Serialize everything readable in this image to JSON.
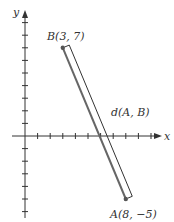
{
  "diagram": {
    "axes": {
      "x_label": "x",
      "y_label": "y",
      "origin_px": [
        25,
        136
      ],
      "unit_px": 12.6,
      "x_ticks": [
        1,
        2,
        3,
        4,
        5,
        6,
        7,
        8,
        9,
        10
      ],
      "y_ticks": [
        -6,
        -5,
        -4,
        -3,
        -2,
        -1,
        1,
        2,
        3,
        4,
        5,
        6,
        7,
        8,
        9
      ]
    },
    "points": [
      {
        "name": "B",
        "x": 3,
        "y": 7,
        "label": "B(3, 7)"
      },
      {
        "name": "A",
        "x": 8,
        "y": -5,
        "label": "A(8, −5)"
      }
    ],
    "segment_label": "d(A, B)",
    "colors": {
      "axis": "#333333",
      "segment": "#666666",
      "point": "#555555",
      "bracket": "#333333",
      "text": "#333333"
    }
  }
}
